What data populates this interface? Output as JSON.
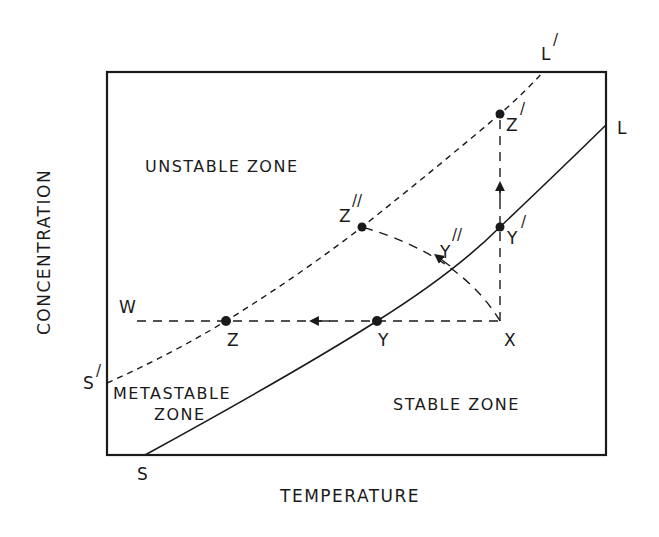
{
  "diagram": {
    "type": "solubility-supersolubility diagram",
    "axes": {
      "x_label": "TEMPERATURE",
      "y_label": "CONCENTRATION"
    },
    "zones": {
      "unstable": "UNSTABLE ZONE",
      "metastable_line1": "METASTABLE",
      "metastable_line2": "ZONE",
      "stable": "STABLE ZONE"
    },
    "curves": {
      "solubility": {
        "start": "S",
        "end": "L",
        "style": "solid"
      },
      "supersolubility": {
        "start": "S",
        "start_prime": "/",
        "end": "L",
        "end_prime": "/",
        "style": "dashed"
      }
    },
    "points": {
      "W": "W",
      "Z": "Z",
      "Y": "Y",
      "X": "X",
      "Z_double_prime": "Z",
      "Z_double_prime_mark": "//",
      "Y_double_prime": "Y",
      "Y_double_prime_mark": "//",
      "Z_prime": "Z",
      "Z_prime_mark": "/",
      "Y_prime": "Y",
      "Y_prime_mark": "/",
      "S": "S",
      "L": "L"
    },
    "paths": [
      {
        "name": "cooling",
        "from": "X",
        "via": [
          "Y",
          "Z"
        ],
        "to": "W",
        "direction": "left"
      },
      {
        "name": "evaporation",
        "from": "X",
        "via": [
          "Y′"
        ],
        "to": "Z′",
        "direction": "up"
      },
      {
        "name": "combined",
        "from": "X",
        "via": [
          "Y″"
        ],
        "to": "Z″",
        "direction": "up-left"
      }
    ],
    "colors": {
      "ink": "#1a1a1a",
      "background": "#ffffff"
    }
  }
}
